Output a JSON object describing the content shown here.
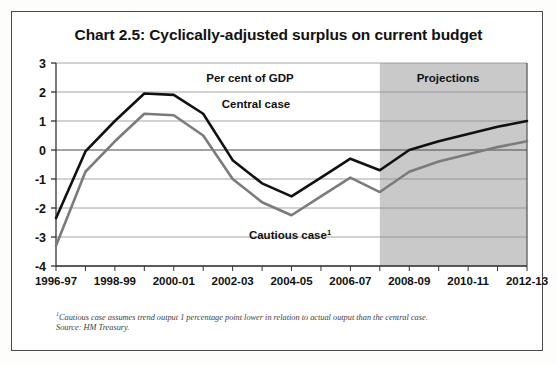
{
  "page": {
    "title": "Chart 2.5: Cyclically-adjusted surplus on current budget"
  },
  "annotations": {
    "units_label": "Per cent of GDP",
    "projections_label": "Projections",
    "central_label": "Central case",
    "cautious_label": "Cautious case",
    "cautious_superscript": "1"
  },
  "footnotes": {
    "marker": "1",
    "note": "Cautious case assumes trend output 1 percentage point lower in relation to actual output than the central case.",
    "source": "Source: HM Treasury."
  },
  "colors": {
    "central_line": "#111111",
    "cautious_line": "#7b7b7b",
    "projection_band": "#c9c9c9",
    "grid": "#8e8e8e",
    "axis": "#333333",
    "frame": "#4a4a4a"
  },
  "chart_data": {
    "type": "line",
    "title": "Chart 2.5: Cyclically-adjusted surplus on current budget",
    "xlabel": "",
    "ylabel": "Per cent of GDP",
    "ylim": [
      -4,
      3
    ],
    "yticks": [
      3,
      2,
      1,
      0,
      -1,
      -2,
      -3,
      -4
    ],
    "ytick_labels": [
      "3",
      "2",
      "1",
      "0",
      "-1",
      "-2",
      "-3",
      "-4"
    ],
    "grid": true,
    "legend": "inline-annotations",
    "x": [
      "1996-97",
      "1997-98",
      "1998-99",
      "1999-00",
      "2000-01",
      "2001-02",
      "2002-03",
      "2003-04",
      "2004-05",
      "2005-06",
      "2006-07",
      "2007-08",
      "2008-09",
      "2009-10",
      "2010-11",
      "2011-12",
      "2012-13"
    ],
    "xtick_labels": [
      "1996-97",
      "1998-99",
      "2000-01",
      "2002-03",
      "2004-05",
      "2006-07",
      "2008-09",
      "2010-11",
      "2012-13"
    ],
    "xtick_indices": [
      0,
      2,
      4,
      6,
      8,
      10,
      12,
      14,
      16
    ],
    "projection_start_index": 11,
    "projection_start_label": "2007-08",
    "series": [
      {
        "name": "Central case",
        "color": "#111111",
        "values": [
          -2.35,
          -0.05,
          1.0,
          1.95,
          1.9,
          1.25,
          -0.35,
          -1.15,
          -1.6,
          -0.95,
          -0.3,
          -0.7,
          0.0,
          0.3,
          0.55,
          0.8,
          1.0
        ]
      },
      {
        "name": "Cautious case",
        "color": "#7b7b7b",
        "values": [
          -3.3,
          -0.75,
          0.3,
          1.25,
          1.2,
          0.5,
          -1.0,
          -1.8,
          -2.25,
          -1.6,
          -0.95,
          -1.45,
          -0.75,
          -0.4,
          -0.15,
          0.1,
          0.3
        ]
      }
    ]
  }
}
